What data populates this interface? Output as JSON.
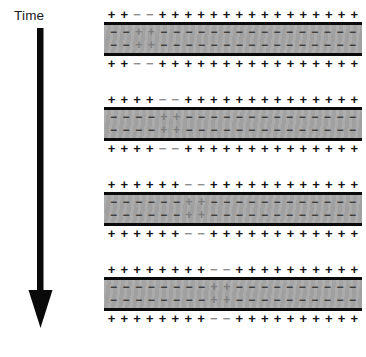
{
  "figure": {
    "background_color": "#ffffff"
  },
  "time_axis": {
    "label": "Time",
    "direction": "downward",
    "arrow_color": "#0a0a0a"
  },
  "symbols": {
    "plus": "+",
    "minus": "−"
  },
  "colors": {
    "slab_fill": "#a8a8a8",
    "slab_border": "#0a0a0a",
    "outer_plus": "#121212",
    "outer_minus": "#8e8e8e",
    "inner_minus": "#3b3b3b",
    "inner_plus": "#7d7d7d"
  },
  "chart_data": {
    "type": "diagram",
    "columns": 20,
    "panels": 4,
    "defect_positions": [
      3,
      5,
      7,
      9
    ],
    "series": [
      {
        "name": "panel-1 outer top",
        "values": [
          "+",
          "+",
          "-",
          "-",
          "+",
          "+",
          "+",
          "+",
          "+",
          "+",
          "+",
          "+",
          "+",
          "+",
          "+",
          "+",
          "+",
          "+",
          "+",
          "+"
        ]
      },
      {
        "name": "panel-1 inner top",
        "values": [
          "-",
          "-",
          "+",
          "+",
          "-",
          "-",
          "-",
          "-",
          "-",
          "-",
          "-",
          "-",
          "-",
          "-",
          "-",
          "-",
          "-",
          "-",
          "-",
          "-"
        ]
      },
      {
        "name": "panel-1 inner bottom",
        "values": [
          "-",
          "-",
          "+",
          "+",
          "-",
          "-",
          "-",
          "-",
          "-",
          "-",
          "-",
          "-",
          "-",
          "-",
          "-",
          "-",
          "-",
          "-",
          "-",
          "-"
        ]
      },
      {
        "name": "panel-1 outer bottom",
        "values": [
          "+",
          "+",
          "-",
          "-",
          "+",
          "+",
          "+",
          "+",
          "+",
          "+",
          "+",
          "+",
          "+",
          "+",
          "+",
          "+",
          "+",
          "+",
          "+",
          "+"
        ]
      },
      {
        "name": "panel-2 outer top",
        "values": [
          "+",
          "+",
          "+",
          "+",
          "-",
          "-",
          "+",
          "+",
          "+",
          "+",
          "+",
          "+",
          "+",
          "+",
          "+",
          "+",
          "+",
          "+",
          "+",
          "+"
        ]
      },
      {
        "name": "panel-2 inner top",
        "values": [
          "-",
          "-",
          "-",
          "-",
          "+",
          "+",
          "-",
          "-",
          "-",
          "-",
          "-",
          "-",
          "-",
          "-",
          "-",
          "-",
          "-",
          "-",
          "-",
          "-"
        ]
      },
      {
        "name": "panel-2 inner bottom",
        "values": [
          "-",
          "-",
          "-",
          "-",
          "+",
          "+",
          "-",
          "-",
          "-",
          "-",
          "-",
          "-",
          "-",
          "-",
          "-",
          "-",
          "-",
          "-",
          "-",
          "-"
        ]
      },
      {
        "name": "panel-2 outer bottom",
        "values": [
          "+",
          "+",
          "+",
          "+",
          "-",
          "-",
          "+",
          "+",
          "+",
          "+",
          "+",
          "+",
          "+",
          "+",
          "+",
          "+",
          "+",
          "+",
          "+",
          "+"
        ]
      },
      {
        "name": "panel-3 outer top",
        "values": [
          "+",
          "+",
          "+",
          "+",
          "+",
          "+",
          "-",
          "-",
          "+",
          "+",
          "+",
          "+",
          "+",
          "+",
          "+",
          "+",
          "+",
          "+",
          "+",
          "+"
        ]
      },
      {
        "name": "panel-3 inner top",
        "values": [
          "-",
          "-",
          "-",
          "-",
          "-",
          "-",
          "+",
          "+",
          "-",
          "-",
          "-",
          "-",
          "-",
          "-",
          "-",
          "-",
          "-",
          "-",
          "-",
          "-"
        ]
      },
      {
        "name": "panel-3 inner bottom",
        "values": [
          "-",
          "-",
          "-",
          "-",
          "-",
          "-",
          "+",
          "+",
          "-",
          "-",
          "-",
          "-",
          "-",
          "-",
          "-",
          "-",
          "-",
          "-",
          "-",
          "-"
        ]
      },
      {
        "name": "panel-3 outer bottom",
        "values": [
          "+",
          "+",
          "+",
          "+",
          "+",
          "+",
          "-",
          "-",
          "+",
          "+",
          "+",
          "+",
          "+",
          "+",
          "+",
          "+",
          "+",
          "+",
          "+",
          "+"
        ]
      },
      {
        "name": "panel-4 outer top",
        "values": [
          "+",
          "+",
          "+",
          "+",
          "+",
          "+",
          "+",
          "+",
          "-",
          "-",
          "+",
          "+",
          "+",
          "+",
          "+",
          "+",
          "+",
          "+",
          "+",
          "+"
        ]
      },
      {
        "name": "panel-4 inner top",
        "values": [
          "-",
          "-",
          "-",
          "-",
          "-",
          "-",
          "-",
          "-",
          "+",
          "+",
          "-",
          "-",
          "-",
          "-",
          "-",
          "-",
          "-",
          "-",
          "-",
          "-"
        ]
      },
      {
        "name": "panel-4 inner bottom",
        "values": [
          "-",
          "-",
          "-",
          "-",
          "-",
          "-",
          "-",
          "-",
          "+",
          "+",
          "-",
          "-",
          "-",
          "-",
          "-",
          "-",
          "-",
          "-",
          "-",
          "-"
        ]
      },
      {
        "name": "panel-4 outer bottom",
        "values": [
          "+",
          "+",
          "+",
          "+",
          "+",
          "+",
          "+",
          "+",
          "-",
          "-",
          "+",
          "+",
          "+",
          "+",
          "+",
          "+",
          "+",
          "+",
          "+",
          "+"
        ]
      }
    ]
  },
  "panels": [
    {
      "name": "panel-1",
      "outer_top": [
        "+",
        "+",
        "-",
        "-",
        "+",
        "+",
        "+",
        "+",
        "+",
        "+",
        "+",
        "+",
        "+",
        "+",
        "+",
        "+",
        "+",
        "+",
        "+",
        "+"
      ],
      "inner_top": [
        "-",
        "-",
        "+",
        "+",
        "-",
        "-",
        "-",
        "-",
        "-",
        "-",
        "-",
        "-",
        "-",
        "-",
        "-",
        "-",
        "-",
        "-",
        "-",
        "-"
      ],
      "inner_bottom": [
        "-",
        "-",
        "+",
        "+",
        "-",
        "-",
        "-",
        "-",
        "-",
        "-",
        "-",
        "-",
        "-",
        "-",
        "-",
        "-",
        "-",
        "-",
        "-",
        "-"
      ],
      "outer_bottom": [
        "+",
        "+",
        "-",
        "-",
        "+",
        "+",
        "+",
        "+",
        "+",
        "+",
        "+",
        "+",
        "+",
        "+",
        "+",
        "+",
        "+",
        "+",
        "+",
        "+"
      ]
    },
    {
      "name": "panel-2",
      "outer_top": [
        "+",
        "+",
        "+",
        "+",
        "-",
        "-",
        "+",
        "+",
        "+",
        "+",
        "+",
        "+",
        "+",
        "+",
        "+",
        "+",
        "+",
        "+",
        "+",
        "+"
      ],
      "inner_top": [
        "-",
        "-",
        "-",
        "-",
        "+",
        "+",
        "-",
        "-",
        "-",
        "-",
        "-",
        "-",
        "-",
        "-",
        "-",
        "-",
        "-",
        "-",
        "-",
        "-"
      ],
      "inner_bottom": [
        "-",
        "-",
        "-",
        "-",
        "+",
        "+",
        "-",
        "-",
        "-",
        "-",
        "-",
        "-",
        "-",
        "-",
        "-",
        "-",
        "-",
        "-",
        "-",
        "-"
      ],
      "outer_bottom": [
        "+",
        "+",
        "+",
        "+",
        "-",
        "-",
        "+",
        "+",
        "+",
        "+",
        "+",
        "+",
        "+",
        "+",
        "+",
        "+",
        "+",
        "+",
        "+",
        "+"
      ]
    },
    {
      "name": "panel-3",
      "outer_top": [
        "+",
        "+",
        "+",
        "+",
        "+",
        "+",
        "-",
        "-",
        "+",
        "+",
        "+",
        "+",
        "+",
        "+",
        "+",
        "+",
        "+",
        "+",
        "+",
        "+"
      ],
      "inner_top": [
        "-",
        "-",
        "-",
        "-",
        "-",
        "-",
        "+",
        "+",
        "-",
        "-",
        "-",
        "-",
        "-",
        "-",
        "-",
        "-",
        "-",
        "-",
        "-",
        "-"
      ],
      "inner_bottom": [
        "-",
        "-",
        "-",
        "-",
        "-",
        "-",
        "+",
        "+",
        "-",
        "-",
        "-",
        "-",
        "-",
        "-",
        "-",
        "-",
        "-",
        "-",
        "-",
        "-"
      ],
      "outer_bottom": [
        "+",
        "+",
        "+",
        "+",
        "+",
        "+",
        "-",
        "-",
        "+",
        "+",
        "+",
        "+",
        "+",
        "+",
        "+",
        "+",
        "+",
        "+",
        "+",
        "+"
      ]
    },
    {
      "name": "panel-4",
      "outer_top": [
        "+",
        "+",
        "+",
        "+",
        "+",
        "+",
        "+",
        "+",
        "-",
        "-",
        "+",
        "+",
        "+",
        "+",
        "+",
        "+",
        "+",
        "+",
        "+",
        "+"
      ],
      "inner_top": [
        "-",
        "-",
        "-",
        "-",
        "-",
        "-",
        "-",
        "-",
        "+",
        "+",
        "-",
        "-",
        "-",
        "-",
        "-",
        "-",
        "-",
        "-",
        "-",
        "-"
      ],
      "inner_bottom": [
        "-",
        "-",
        "-",
        "-",
        "-",
        "-",
        "-",
        "-",
        "+",
        "+",
        "-",
        "-",
        "-",
        "-",
        "-",
        "-",
        "-",
        "-",
        "-",
        "-"
      ],
      "outer_bottom": [
        "+",
        "+",
        "+",
        "+",
        "+",
        "+",
        "+",
        "+",
        "-",
        "-",
        "+",
        "+",
        "+",
        "+",
        "+",
        "+",
        "+",
        "+",
        "+",
        "+"
      ]
    }
  ]
}
